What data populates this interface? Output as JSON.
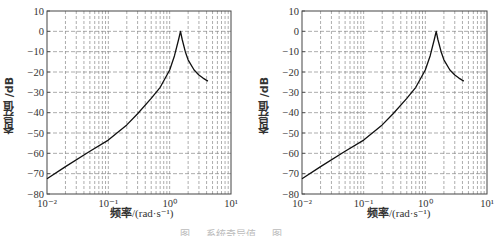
{
  "figure": {
    "caption": "图 ... 系统奇异值 ... 图"
  },
  "charts": [
    {
      "id": "left",
      "ylabel": "奇异值 /dB",
      "xlabel_cn": "频率",
      "xlabel_unit": "/(rad·s⁻¹)",
      "yticks": [
        "10",
        "0",
        "−10",
        "−20",
        "−30",
        "−40",
        "−50",
        "−60",
        "−70",
        "−80"
      ],
      "xticks": [
        "10⁻²",
        "10⁻¹",
        "10⁰",
        "10¹"
      ]
    },
    {
      "id": "right",
      "ylabel": "奇异值 /dB",
      "xlabel_cn": "频率",
      "xlabel_unit": "/(rad·s⁻¹)",
      "yticks": [
        "10",
        "0",
        "−10",
        "−20",
        "−30",
        "−40",
        "−50",
        "−60",
        "−70",
        "−80"
      ],
      "xticks": [
        "10⁻²",
        "10⁻¹",
        "10⁰",
        "10¹"
      ]
    }
  ],
  "chart_data": [
    {
      "type": "line",
      "title": "",
      "xlabel": "频率/(rad·s⁻¹)",
      "ylabel": "奇异值 /dB",
      "xscale": "log",
      "xlim": [
        0.01,
        10
      ],
      "ylim": [
        -80,
        10
      ],
      "grid": true,
      "x": [
        0.01,
        0.02,
        0.05,
        0.1,
        0.2,
        0.3,
        0.5,
        0.7,
        1.0,
        1.2,
        1.4,
        1.5,
        1.6,
        1.8,
        2.0,
        2.5,
        3.0,
        3.5,
        4.2
      ],
      "series": [
        {
          "name": "singular value",
          "values": [
            -72.5,
            -66.5,
            -59,
            -53.5,
            -46,
            -40.5,
            -33,
            -27.5,
            -19,
            -12,
            -4,
            0,
            -4,
            -10,
            -14,
            -19,
            -21.5,
            -23,
            -24.5
          ]
        }
      ]
    },
    {
      "type": "line",
      "title": "",
      "xlabel": "频率/(rad·s⁻¹)",
      "ylabel": "奇异值 /dB",
      "xscale": "log",
      "xlim": [
        0.01,
        10
      ],
      "ylim": [
        -80,
        10
      ],
      "grid": true,
      "x": [
        0.01,
        0.02,
        0.05,
        0.1,
        0.2,
        0.3,
        0.5,
        0.7,
        1.0,
        1.2,
        1.4,
        1.5,
        1.6,
        1.8,
        2.0,
        2.5,
        3.0,
        3.5,
        4.2
      ],
      "series": [
        {
          "name": "singular value",
          "values": [
            -72.5,
            -66.5,
            -59,
            -53.5,
            -46,
            -40.5,
            -33,
            -27.5,
            -19,
            -12,
            -4,
            0,
            -4,
            -10,
            -14,
            -19,
            -21.5,
            -23,
            -24.5
          ]
        }
      ]
    }
  ]
}
